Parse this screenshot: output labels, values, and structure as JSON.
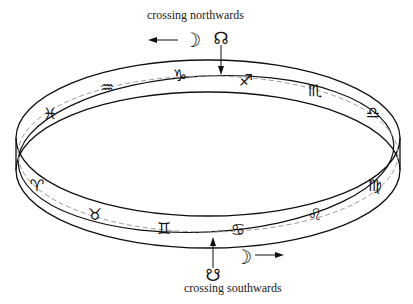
{
  "diagram": {
    "labels": {
      "north": "crossing northwards",
      "south": "crossing southwards"
    },
    "symbols": {
      "moon_north": "☽",
      "ascending_node": "☊",
      "moon_south": "☽",
      "descending_node": "☋"
    },
    "zodiac": [
      {
        "name": "pisces",
        "glyph": "♓"
      },
      {
        "name": "aquarius",
        "glyph": "♒"
      },
      {
        "name": "capricorn",
        "glyph": "♑"
      },
      {
        "name": "sagittarius",
        "glyph": "♐"
      },
      {
        "name": "scorpio",
        "glyph": "♏"
      },
      {
        "name": "libra",
        "glyph": "♎"
      },
      {
        "name": "virgo",
        "glyph": "♍"
      },
      {
        "name": "leo",
        "glyph": "♌"
      },
      {
        "name": "cancer",
        "glyph": "♋"
      },
      {
        "name": "gemini",
        "glyph": "♊"
      },
      {
        "name": "taurus",
        "glyph": "♉"
      },
      {
        "name": "aries",
        "glyph": "♈"
      }
    ],
    "colors": {
      "ink": "#111111",
      "dashed": "#9a9a9a",
      "background": "#ffffff"
    }
  }
}
